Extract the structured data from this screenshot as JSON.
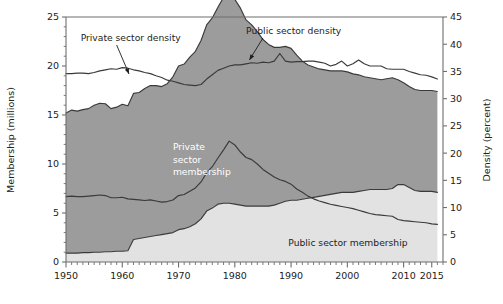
{
  "chart_data": {
    "type": "area",
    "title": "",
    "subtitle": "",
    "xlabel": "",
    "ylabel": "Membership (millions)",
    "y2label": "Density (percent)",
    "xlim": [
      1950,
      2017
    ],
    "ylim": [
      0,
      25
    ],
    "y2lim": [
      0,
      45
    ],
    "grid": false,
    "legend_position": "inline-annotations",
    "x_ticks": [
      1950,
      1960,
      1970,
      1980,
      1990,
      2000,
      2010,
      2015
    ],
    "x_tick_labels": [
      "1950",
      "1960",
      "1970",
      "1980",
      "1990",
      "2000",
      "2010",
      "2015"
    ],
    "x_minor_tick_step": 1,
    "y_ticks": [
      0,
      5,
      10,
      15,
      20,
      25
    ],
    "y_tick_labels": [
      "0",
      "5",
      "10",
      "15",
      "20",
      "25"
    ],
    "y2_ticks": [
      0,
      5,
      10,
      15,
      20,
      25,
      30,
      35,
      40,
      45
    ],
    "y2_tick_labels": [
      "0",
      "5",
      "10",
      "15",
      "20",
      "25",
      "30",
      "35",
      "40",
      "45"
    ],
    "colors": {
      "private_membership_fill": "#9c9c9c",
      "public_membership_fill": "#e2e2e2",
      "line": "#3a3a3a",
      "axis": "#6e6e6e",
      "text_dark": "#1d1d1d",
      "text_light": "#ffffff",
      "background": "#ffffff"
    },
    "annotations": [
      {
        "name": "private-sector-density-label",
        "text": "Private sector density",
        "text_x": 1952.6,
        "text_y_px": 41,
        "anchor": "start",
        "color": "#1d1d1d",
        "leader_from": [
          1959.0,
          45
        ],
        "leader_to": [
          1961.2,
          74
        ]
      },
      {
        "name": "public-sector-density-label",
        "text": "Public sector density",
        "text_x": 1982.0,
        "text_y_px": 34,
        "anchor": "start",
        "color": "#1d1d1d",
        "leader_from": [
          1985.0,
          38
        ],
        "leader_to": [
          1982.6,
          60
        ]
      },
      {
        "name": "private-sector-membership-label",
        "text": [
          "Private",
          "sector",
          "membership"
        ],
        "text_x": 1969.0,
        "text_y_px": 150,
        "anchor": "start",
        "color": "#ffffff"
      },
      {
        "name": "public-sector-membership-label",
        "text": "Public sector membership",
        "text_x": 1989.5,
        "text_y_px": 246,
        "anchor": "start",
        "color": "#1d1d1d"
      }
    ],
    "x": [
      1950,
      1951,
      1952,
      1953,
      1954,
      1955,
      1956,
      1957,
      1958,
      1959,
      1960,
      1961,
      1962,
      1963,
      1964,
      1965,
      1966,
      1967,
      1968,
      1969,
      1970,
      1971,
      1972,
      1973,
      1974,
      1975,
      1976,
      1977,
      1978,
      1979,
      1980,
      1981,
      1982,
      1983,
      1984,
      1985,
      1986,
      1987,
      1988,
      1989,
      1990,
      1991,
      1992,
      1993,
      1994,
      1995,
      1996,
      1997,
      1998,
      1999,
      2000,
      2001,
      2002,
      2003,
      2004,
      2005,
      2006,
      2007,
      2008,
      2009,
      2010,
      2011,
      2012,
      2013,
      2014,
      2015,
      2016
    ],
    "series": [
      {
        "name": "Public sector membership",
        "axis": "left",
        "unit": "millions",
        "type": "area",
        "fill": "#e2e2e2",
        "values": [
          0.9,
          0.9,
          0.9,
          0.95,
          0.95,
          1.0,
          1.0,
          1.05,
          1.05,
          1.1,
          1.1,
          1.15,
          2.3,
          2.4,
          2.5,
          2.6,
          2.7,
          2.8,
          2.9,
          3.0,
          3.3,
          3.4,
          3.6,
          3.9,
          4.4,
          5.2,
          5.5,
          5.9,
          6.0,
          6.0,
          5.9,
          5.8,
          5.7,
          5.7,
          5.7,
          5.7,
          5.7,
          5.8,
          6.0,
          6.2,
          6.3,
          6.3,
          6.4,
          6.5,
          6.6,
          6.7,
          6.8,
          6.9,
          7.0,
          7.1,
          7.1,
          7.1,
          7.2,
          7.3,
          7.4,
          7.4,
          7.4,
          7.4,
          7.5,
          7.9,
          7.9,
          7.6,
          7.3,
          7.2,
          7.2,
          7.2,
          7.1
        ]
      },
      {
        "name": "Private sector membership",
        "axis": "left",
        "unit": "millions",
        "type": "area-stacked",
        "fill": "#9c9c9c",
        "values": [
          14.3,
          14.6,
          14.5,
          14.6,
          14.7,
          15.0,
          15.2,
          15.1,
          14.6,
          14.7,
          15.0,
          14.8,
          14.9,
          14.9,
          15.2,
          15.4,
          15.3,
          15.1,
          15.3,
          15.9,
          16.7,
          16.8,
          17.3,
          17.6,
          18.2,
          19.0,
          19.4,
          20.1,
          21.0,
          21.6,
          20.9,
          20.1,
          19.0,
          18.5,
          17.8,
          17.0,
          16.5,
          16.1,
          15.9,
          15.8,
          15.5,
          14.8,
          14.1,
          13.6,
          13.3,
          13.0,
          12.8,
          12.6,
          12.5,
          12.4,
          12.3,
          12.1,
          11.9,
          11.6,
          11.4,
          11.3,
          11.2,
          11.3,
          11.3,
          10.7,
          10.4,
          10.3,
          10.3,
          10.3,
          10.3,
          10.3,
          10.3
        ]
      },
      {
        "name": "Private sector density",
        "axis": "right",
        "unit": "percent",
        "type": "line",
        "stroke": "#3a3a3a",
        "values": [
          12.0,
          12.1,
          12.0,
          12.0,
          12.1,
          12.2,
          12.3,
          12.2,
          11.8,
          11.8,
          11.9,
          11.6,
          11.5,
          11.4,
          11.3,
          11.4,
          11.2,
          11.0,
          11.1,
          11.4,
          12.2,
          12.4,
          13.0,
          13.6,
          14.7,
          16.4,
          17.5,
          19.1,
          20.6,
          22.2,
          21.5,
          20.2,
          19.2,
          18.8,
          18.0,
          17.0,
          16.3,
          15.6,
          15.1,
          14.8,
          14.3,
          13.4,
          12.8,
          12.1,
          11.6,
          11.2,
          10.9,
          10.6,
          10.4,
          10.2,
          10.0,
          9.8,
          9.5,
          9.2,
          8.9,
          8.7,
          8.6,
          8.5,
          8.4,
          7.8,
          7.6,
          7.5,
          7.4,
          7.3,
          7.2,
          7.0,
          6.9
        ]
      },
      {
        "name": "Public sector density",
        "axis": "right",
        "unit": "percent",
        "type": "line",
        "stroke": "#3a3a3a",
        "values": [
          34.6,
          34.6,
          34.7,
          34.7,
          34.6,
          34.8,
          35.1,
          35.3,
          35.5,
          35.4,
          35.7,
          35.6,
          35.3,
          35.1,
          34.8,
          34.6,
          34.2,
          33.9,
          33.4,
          33.2,
          32.9,
          32.6,
          32.5,
          32.4,
          32.6,
          33.6,
          34.4,
          35.2,
          35.6,
          36.0,
          36.2,
          36.2,
          36.4,
          36.6,
          36.5,
          36.7,
          36.6,
          36.9,
          38.3,
          36.9,
          36.7,
          36.8,
          36.8,
          36.9,
          36.9,
          36.7,
          36.5,
          36.0,
          36.3,
          36.9,
          36.0,
          36.4,
          37.1,
          36.4,
          36.0,
          36.0,
          36.0,
          35.5,
          35.4,
          35.4,
          35.4,
          35.0,
          34.7,
          34.4,
          34.3,
          34.0,
          33.6
        ]
      }
    ]
  }
}
